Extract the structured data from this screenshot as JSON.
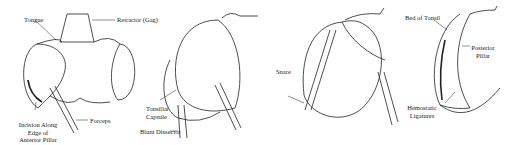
{
  "figures": [
    {
      "id": "panel-1",
      "labels": {
        "tongue": "Tongue",
        "retractor": "Retractor (Gag)",
        "incision": "Incision Along\nEdge of\nAnterior Pillar",
        "forceps": "Forceps"
      }
    },
    {
      "id": "panel-2",
      "labels": {
        "capsule": "Tonsillar\nCapsule",
        "dissector": "Blunt Dissector"
      }
    },
    {
      "id": "panel-3",
      "labels": {
        "snare": "Snare"
      }
    },
    {
      "id": "panel-4",
      "labels": {
        "bed": "Bed of Tonsil",
        "posterior": "Posterior\nPillar",
        "ligatures": "Hemostatic\nLigatures"
      }
    }
  ],
  "colors": {
    "line": "#222222",
    "background": "#ffffff"
  }
}
